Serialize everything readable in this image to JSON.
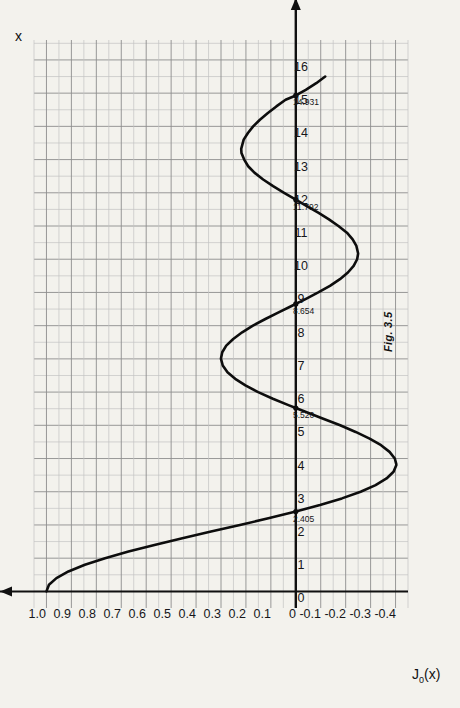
{
  "figure": {
    "caption": "Fig. 3.5",
    "page_ghost_text": "                          "
  },
  "chart_data": {
    "type": "line",
    "title": "",
    "xlabel": "x",
    "ylabel": "J₀(x)",
    "xlim": [
      0,
      16
    ],
    "ylim": [
      -0.45,
      1.05
    ],
    "grid": true,
    "legend": "none",
    "x_ticks": [
      "0",
      "1",
      "2",
      "3",
      "4",
      "5",
      "6",
      "7",
      "8",
      "9",
      "10",
      "11",
      "12",
      "13",
      "14",
      "15",
      "16"
    ],
    "x_tick_values": [
      0,
      1,
      2,
      3,
      4,
      5,
      6,
      7,
      8,
      9,
      10,
      11,
      12,
      13,
      14,
      15,
      16
    ],
    "y_ticks": [
      "1.0",
      "0.9",
      "0.8",
      "0.7",
      "0.6",
      "0.5",
      "0.4",
      "0.3",
      "0.2",
      "0.1",
      "0",
      "-0.1",
      "-0.2",
      "-0.3",
      "-0.4"
    ],
    "y_tick_values": [
      1.0,
      0.9,
      0.8,
      0.7,
      0.6,
      0.5,
      0.4,
      0.3,
      0.2,
      0.1,
      0,
      -0.1,
      -0.2,
      -0.3,
      -0.4
    ],
    "annotations": [
      {
        "label": "2.405",
        "x": 2.405,
        "y": 0
      },
      {
        "label": "5.520",
        "x": 5.52,
        "y": 0
      },
      {
        "label": "8.654",
        "x": 8.654,
        "y": 0
      },
      {
        "label": "11.792",
        "x": 11.792,
        "y": 0
      },
      {
        "label": "14.931",
        "x": 14.931,
        "y": 0
      }
    ],
    "series": [
      {
        "name": "J0(x)",
        "x": [
          0,
          0.2,
          0.4,
          0.6,
          0.8,
          1.0,
          1.2,
          1.4,
          1.6,
          1.8,
          2.0,
          2.2,
          2.405,
          2.6,
          2.8,
          3.0,
          3.2,
          3.4,
          3.6,
          3.8,
          3.83,
          4.0,
          4.2,
          4.4,
          4.6,
          4.8,
          5.0,
          5.2,
          5.4,
          5.52,
          5.6,
          5.8,
          6.0,
          6.2,
          6.4,
          6.6,
          6.8,
          7.0,
          7.016,
          7.2,
          7.4,
          7.6,
          7.8,
          8.0,
          8.2,
          8.4,
          8.6,
          8.654,
          8.8,
          9.0,
          9.2,
          9.4,
          9.6,
          9.8,
          10.0,
          10.17,
          10.4,
          10.6,
          10.8,
          11.0,
          11.2,
          11.4,
          11.6,
          11.792,
          12.0,
          12.2,
          12.4,
          12.6,
          12.8,
          13.0,
          13.2,
          13.324,
          13.6,
          13.8,
          14.0,
          14.2,
          14.4,
          14.6,
          14.8,
          14.931,
          15.1,
          15.3,
          15.5
        ],
        "y": [
          1.0,
          0.99,
          0.96,
          0.912,
          0.846,
          0.765,
          0.671,
          0.567,
          0.455,
          0.34,
          0.224,
          0.11,
          0.0,
          -0.097,
          -0.185,
          -0.26,
          -0.32,
          -0.364,
          -0.392,
          -0.403,
          -0.403,
          -0.397,
          -0.376,
          -0.342,
          -0.296,
          -0.24,
          -0.178,
          -0.11,
          -0.041,
          0.0,
          0.027,
          0.092,
          0.151,
          0.202,
          0.243,
          0.274,
          0.293,
          0.3,
          0.3,
          0.295,
          0.279,
          0.251,
          0.215,
          0.172,
          0.122,
          0.069,
          0.015,
          0.0,
          -0.039,
          -0.09,
          -0.137,
          -0.177,
          -0.209,
          -0.232,
          -0.246,
          -0.25,
          -0.243,
          -0.228,
          -0.205,
          -0.171,
          -0.133,
          -0.09,
          -0.044,
          0.0,
          0.047,
          0.091,
          0.131,
          0.165,
          0.191,
          0.207,
          0.218,
          0.219,
          0.209,
          0.192,
          0.171,
          0.144,
          0.112,
          0.078,
          0.041,
          0.0,
          -0.04,
          -0.082,
          -0.118
        ]
      }
    ]
  },
  "axes": {
    "x_axis_name": "x",
    "y_axis_name": "J₀(x)",
    "y_axis_label_main": "J",
    "y_axis_label_sub": "0",
    "y_axis_label_arg": "(x)"
  }
}
